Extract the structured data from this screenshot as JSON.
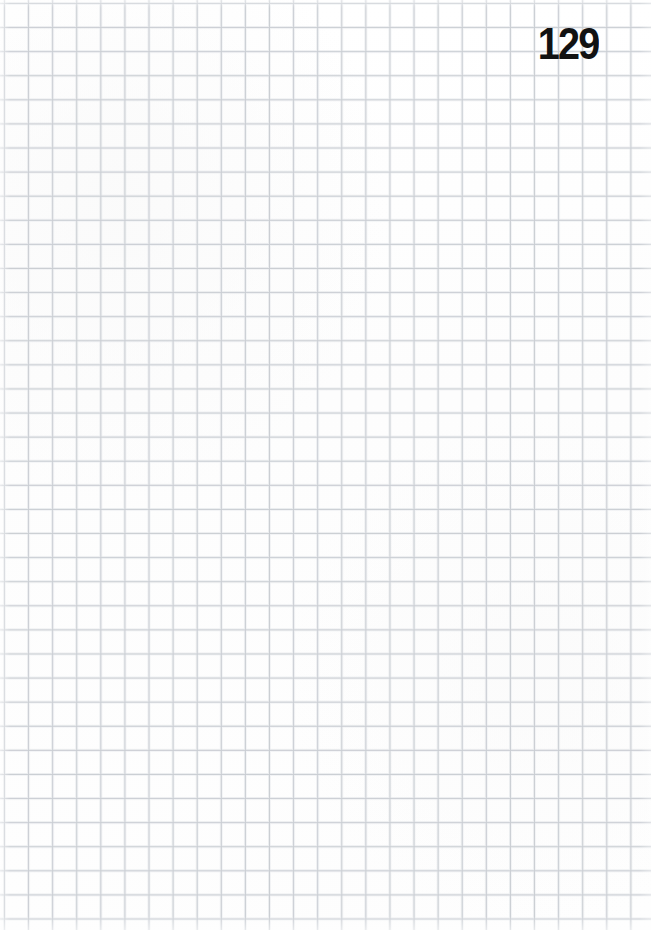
{
  "page": {
    "kind": "scanned-grid-paper-page",
    "width": 651,
    "height": 930,
    "page_number": "129",
    "body_text": "",
    "background_color": "#fdfdfd",
    "grid": {
      "line_color": "#c6cad0",
      "halo_color": "#dfe2e6",
      "cell_size_px": 24.1,
      "origin_x_px": 4,
      "origin_y_px": 3,
      "style": "quadrille",
      "extends_to_edges": true
    },
    "page_number_style": {
      "color": "#121212",
      "weight": "bold",
      "position": "top-right"
    }
  }
}
